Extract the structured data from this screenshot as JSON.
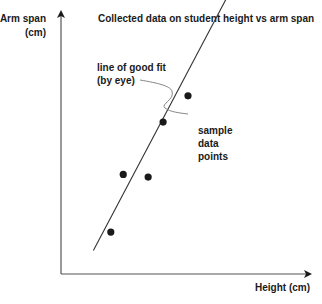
{
  "chart_data": {
    "type": "scatter",
    "title": "Collected data on student height vs arm span",
    "xlabel": "Height (cm)",
    "ylabel_lines": [
      "Arm span",
      "(cm)"
    ],
    "grid": false,
    "x_ticks": [],
    "y_ticks": [],
    "xlim": [
      0,
      100
    ],
    "ylim": [
      0,
      100
    ],
    "points": [
      {
        "x": 20,
        "y": 16
      },
      {
        "x": 25,
        "y": 38
      },
      {
        "x": 35,
        "y": 37
      },
      {
        "x": 41,
        "y": 58
      },
      {
        "x": 51,
        "y": 68
      },
      {
        "x": 61,
        "y": 113
      }
    ],
    "fit_line": {
      "x1": 13,
      "y1": 9,
      "x2": 68,
      "y2": 108
    },
    "annotations": [
      {
        "lines": [
          "line of good fit",
          "(by eye)"
        ],
        "target": "fit_line"
      },
      {
        "lines": [
          "sample",
          "data",
          "points"
        ],
        "target": "points"
      }
    ]
  },
  "colors": {
    "ink": "#1a1a1a",
    "axis": "#555555",
    "background": "#ffffff"
  }
}
